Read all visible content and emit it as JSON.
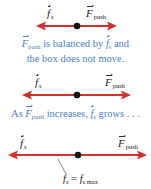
{
  "colors": {
    "arrow": "#d2302c",
    "dot": "#111111",
    "caption": "#4a7fc1",
    "label": "#1a1a1a"
  },
  "panels": [
    {
      "friction_label": {
        "symbol": "f",
        "subscript": "s"
      },
      "push_label": {
        "symbol": "F",
        "subscript": "push"
      },
      "caption": {
        "line1_pre_symbol": "F",
        "line1_pre_sub": "push",
        "line1_middle": " is balanced by ",
        "line1_post_symbol": "f",
        "line1_post_sub": "s",
        "line1_end": " and",
        "line2": "the box does not move."
      }
    },
    {
      "friction_label": {
        "symbol": "f",
        "subscript": "s"
      },
      "push_label": {
        "symbol": "F",
        "subscript": "push"
      },
      "caption": {
        "prefix": "As ",
        "symbol1": "F",
        "symbol1_sub": "push",
        "middle": " increases, ",
        "symbol2": "f",
        "symbol2_sub": "s",
        "suffix": " grows . . ."
      }
    },
    {
      "friction_label": {
        "symbol": "f",
        "subscript": "s"
      },
      "push_label": {
        "symbol": "F",
        "subscript": "push"
      },
      "annotation": {
        "lhs_symbol": "f",
        "lhs_sub": "s",
        "operator": " = ",
        "rhs_symbol": "f",
        "rhs_sub": "s max"
      }
    }
  ]
}
